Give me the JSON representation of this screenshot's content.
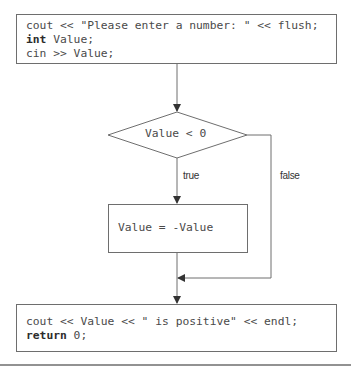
{
  "flowchart": {
    "start_block": {
      "lines": [
        {
          "keyword": "",
          "text": "cout << \"Please enter a number: \" << flush;"
        },
        {
          "keyword": "int",
          "text": " Value;"
        },
        {
          "keyword": "",
          "text": "cin >> Value;"
        }
      ]
    },
    "decision": {
      "text": "Value < 0"
    },
    "true_label": "true",
    "false_label": "false",
    "process_block": {
      "text": "Value = -Value"
    },
    "end_block": {
      "lines": [
        {
          "keyword": "",
          "text": "cout << Value << \" is positive\" << endl;"
        },
        {
          "keyword": "return",
          "text": " 0;"
        }
      ]
    }
  },
  "colors": {
    "stroke": "#6e6e6e",
    "text": "#4a4a4a"
  }
}
